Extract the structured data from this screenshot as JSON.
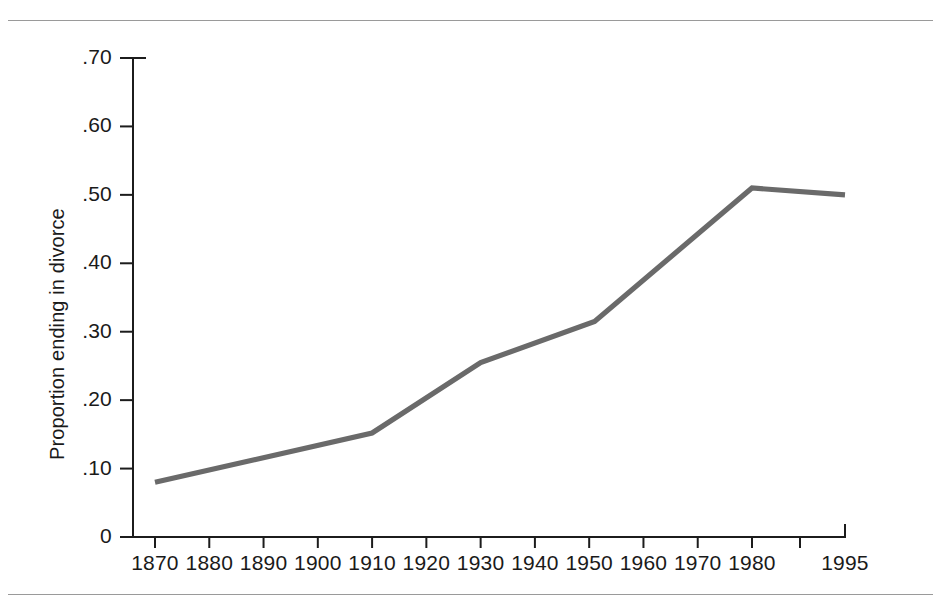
{
  "figure": {
    "background_color": "#ffffff",
    "rule_color": "#9a9a9a",
    "axis_color": "#1c1c1c"
  },
  "chart_data": {
    "type": "line",
    "title": "",
    "subtitle": "",
    "xlabel": "",
    "ylabel": "Proportion ending in divorce",
    "xlim": [
      1870,
      1995
    ],
    "ylim": [
      0,
      0.7
    ],
    "grid": false,
    "legend": false,
    "legend_position": "none",
    "series_color": "#6a6a6a",
    "x_tick_labels": [
      "1870",
      "1880",
      "1890",
      "1900",
      "1910",
      "1920",
      "1930",
      "1940",
      "1950",
      "1960",
      "1970",
      "1980",
      "",
      "1995"
    ],
    "x_tick_values": [
      1870,
      1880,
      1890,
      1900,
      1910,
      1920,
      1930,
      1940,
      1950,
      1960,
      1970,
      1980,
      1990,
      1995
    ],
    "y_tick_labels": [
      "0",
      ".10",
      ".20",
      ".30",
      ".40",
      ".50",
      ".60",
      ".70"
    ],
    "y_tick_values": [
      0,
      0.1,
      0.2,
      0.3,
      0.4,
      0.5,
      0.6,
      0.7
    ],
    "series": [
      {
        "name": "Proportion of marriages ending in divorce",
        "x": [
          1870,
          1910,
          1930,
          1951,
          1980,
          1995
        ],
        "values": [
          0.08,
          0.152,
          0.255,
          0.315,
          0.51,
          0.5
        ]
      }
    ],
    "annotations": []
  }
}
